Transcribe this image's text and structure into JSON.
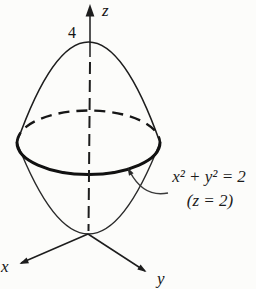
{
  "figure": {
    "axes": {
      "x_label": "x",
      "y_label": "y",
      "z_label": "z"
    },
    "z_axis_tick": "4",
    "annotation": {
      "equation": "x² + y² = 2",
      "condition": "(z = 2)"
    },
    "colors": {
      "upper_surface": "#a7a7a5",
      "lower_surface": "#d7d6d3",
      "outline": "#1d1d1d",
      "background": "#fcfcfa"
    }
  }
}
